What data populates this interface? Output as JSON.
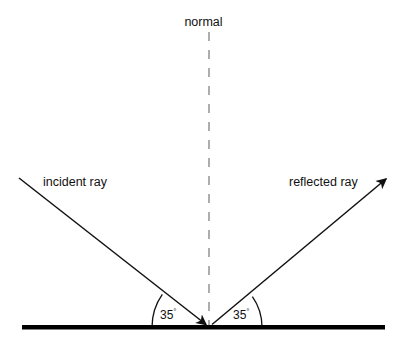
{
  "diagram": {
    "title_text": "normal",
    "labels": {
      "normal": "normal",
      "incident_ray": "incident ray",
      "reflected_ray": "reflected ray",
      "angle_of_incidence": "35",
      "angle_of_reflection": "35",
      "degree_symbol": "°"
    },
    "values": {
      "angle_of_incidence_deg": 35,
      "angle_of_reflection_deg": 35
    },
    "colors": {
      "ray_stroke": "#111111",
      "mirror_fill": "#000000",
      "normal_dashed_stroke": "#9a9a9a",
      "arc_stroke": "#111111",
      "background": "#ffffff",
      "text": "#111111"
    },
    "geometry": {
      "vertex_x": 209,
      "vertex_y": 327,
      "mirror_x1": 22,
      "mirror_x2": 385,
      "mirror_y": 327,
      "mirror_thickness": 4.5,
      "normal_top_y": 32,
      "incident_start_x": 19,
      "incident_start_y": 178,
      "reflected_end_x": 388,
      "reflected_end_y": 177,
      "arc_incidence_radius": 57,
      "arc_reflection_radius": 53
    }
  }
}
